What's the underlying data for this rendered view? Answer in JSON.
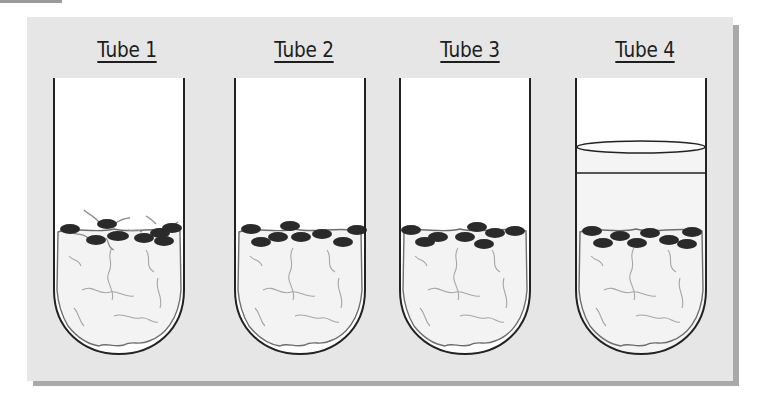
{
  "figure": {
    "type": "comparison diagram",
    "background_color": "#e6e6e6",
    "tubes": [
      {
        "label": "Tube 1",
        "has_liquid_layer": false,
        "seeds_sprouting": true,
        "seed_count": 8
      },
      {
        "label": "Tube 2",
        "has_liquid_layer": false,
        "seeds_sprouting": false,
        "seed_count": 8
      },
      {
        "label": "Tube 3",
        "has_liquid_layer": false,
        "seeds_sprouting": false,
        "seed_count": 8
      },
      {
        "label": "Tube 4",
        "has_liquid_layer": true,
        "seeds_sprouting": false,
        "seed_count": 8
      }
    ]
  },
  "colors": {
    "seed": "#2a2a2a",
    "tube_outline": "#222222",
    "cotton_outline": "#6e6e6e",
    "cotton_fill": "#f2f2f2",
    "root": "#9a9a9a"
  }
}
